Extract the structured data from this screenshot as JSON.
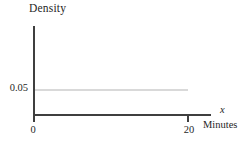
{
  "chart_data": {
    "type": "line",
    "title": "",
    "ylabel": "Density",
    "xlabel": "Minutes",
    "x_variable": "x",
    "x_ticks": [
      0,
      20
    ],
    "x_tick_labels": [
      "0",
      "20"
    ],
    "y_ticks": [
      0.05
    ],
    "y_tick_labels": [
      "0.05"
    ],
    "xlim": [
      0,
      22.5
    ],
    "ylim": [
      0,
      0.08
    ],
    "grid": false,
    "legend_position": "none",
    "series": [
      {
        "name": "uniform-density",
        "x": [
          0,
          20
        ],
        "y": [
          0.05,
          0.05
        ],
        "color": "#d9d9d9"
      }
    ],
    "colors": {
      "axis": "#3f3f3f",
      "text": "#1f1f1f",
      "density_line": "#d9d9d9",
      "background": "#ffffff"
    }
  }
}
